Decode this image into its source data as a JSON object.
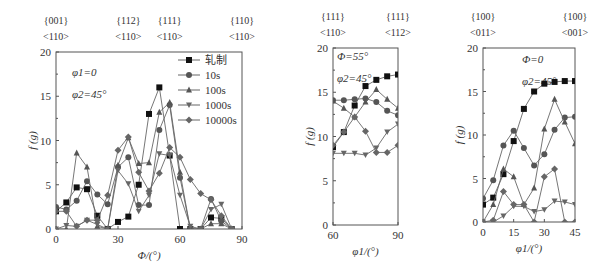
{
  "chart_data": [
    {
      "type": "line",
      "title": "",
      "xlabel": "Φ/(°)",
      "ylabel": "f (g)",
      "xlim": [
        0,
        90
      ],
      "ylim": [
        0,
        20
      ],
      "xticks": [
        0,
        30,
        60,
        90
      ],
      "yticks": [
        0,
        5,
        10,
        15,
        20
      ],
      "top_labels": [
        {
          "x": 0,
          "plane": "{001}",
          "dir": "<110>"
        },
        {
          "x": 35,
          "plane": "{112}",
          "dir": "<110>"
        },
        {
          "x": 55,
          "plane": "{111}",
          "dir": "<110>"
        },
        {
          "x": 90,
          "plane": "{110}",
          "dir": "<110>"
        }
      ],
      "annotations": [
        "φ1=0",
        "φ2=45°"
      ],
      "legend": [
        "轧制",
        "10s",
        "100s",
        "1000s",
        "10000s"
      ],
      "legend_position": "upper right",
      "grid": false,
      "series": [
        {
          "name": "轧制",
          "marker": "square",
          "x": [
            0,
            5,
            10,
            15,
            20,
            25,
            30,
            35,
            40,
            45,
            50,
            55,
            60,
            65,
            70,
            75,
            80,
            85
          ],
          "values": [
            2,
            3,
            4.7,
            4.5,
            1.5,
            0,
            0.8,
            1.4,
            5,
            13,
            16,
            8.3,
            0,
            0,
            0,
            1.3,
            1.2,
            0
          ]
        },
        {
          "name": "10s",
          "marker": "circle",
          "x": [
            0,
            5,
            10,
            15,
            20,
            25,
            30,
            35,
            40,
            45,
            50,
            55,
            60,
            65,
            70,
            75,
            80,
            85
          ],
          "values": [
            2.5,
            2.2,
            3.2,
            5.4,
            3.9,
            2.8,
            7,
            8.1,
            2.7,
            2.7,
            11.2,
            14,
            5.8,
            0,
            0,
            3.4,
            0.9,
            0
          ]
        },
        {
          "name": "100s",
          "marker": "triangle-up",
          "x": [
            0,
            5,
            10,
            15,
            20,
            25,
            30,
            35,
            40,
            45,
            50,
            55,
            60,
            65,
            70,
            75,
            80,
            85
          ],
          "values": [
            0,
            0,
            8.6,
            7,
            0.3,
            0,
            7.2,
            10.3,
            7.4,
            7.5,
            13.2,
            14.3,
            6.4,
            0,
            0,
            0.6,
            0.6,
            0
          ]
        },
        {
          "name": "1000s",
          "marker": "triangle-down",
          "x": [
            0,
            5,
            10,
            15,
            20,
            25,
            30,
            35,
            40,
            45,
            50,
            55,
            60,
            65,
            70,
            75,
            80,
            85
          ],
          "values": [
            0,
            0.4,
            0.3,
            1,
            0.5,
            0,
            6.6,
            5.1,
            2,
            3.8,
            8.5,
            8.3,
            3.8,
            0.3,
            0,
            2.2,
            2.8,
            0
          ]
        },
        {
          "name": "10000s",
          "marker": "diamond",
          "x": [
            0,
            5,
            10,
            15,
            20,
            25,
            30,
            35,
            40,
            45,
            50,
            55,
            60,
            65,
            70,
            75,
            80,
            85
          ],
          "values": [
            2,
            2,
            0.3,
            1,
            1,
            3.8,
            8.9,
            10.4,
            6.4,
            4.3,
            6.3,
            9.2,
            8.1,
            5.6,
            4,
            3.3,
            1.5,
            0
          ]
        }
      ]
    },
    {
      "type": "line",
      "title": "",
      "xlabel": "φ1/(°)",
      "ylabel": "f (g)",
      "xlim": [
        60,
        90
      ],
      "ylim": [
        0,
        20
      ],
      "xticks": [
        60,
        90
      ],
      "yticks": [
        0,
        5,
        10,
        15,
        20
      ],
      "top_labels": [
        {
          "x": 60,
          "plane": "{111}",
          "dir": "<110>"
        },
        {
          "x": 90,
          "plane": "{111}",
          "dir": "<112>"
        }
      ],
      "annotations": [
        "Φ=55°",
        "φ2=45°"
      ],
      "grid": false,
      "series": [
        {
          "name": "轧制",
          "marker": "square",
          "x": [
            60,
            65,
            70,
            75,
            80,
            85,
            90
          ],
          "values": [
            8.8,
            10.5,
            13.5,
            15.7,
            16.4,
            16.8,
            17
          ]
        },
        {
          "name": "10s",
          "marker": "circle",
          "x": [
            60,
            65,
            70,
            75,
            80,
            85,
            90
          ],
          "values": [
            14.1,
            14.1,
            14.2,
            14.3,
            13.9,
            12.9,
            12.4
          ]
        },
        {
          "name": "100s",
          "marker": "triangle-up",
          "x": [
            60,
            65,
            70,
            75,
            80,
            85,
            90
          ],
          "values": [
            14,
            13.2,
            12.2,
            13.9,
            15.3,
            14.2,
            13.2
          ]
        },
        {
          "name": "1000s",
          "marker": "triangle-down",
          "x": [
            60,
            65,
            70,
            75,
            80,
            85,
            90
          ],
          "values": [
            8.1,
            8.1,
            8.1,
            7.9,
            8.7,
            10.5,
            11.4
          ]
        },
        {
          "name": "10000s",
          "marker": "diamond",
          "x": [
            60,
            65,
            70,
            75,
            80,
            85,
            90
          ],
          "values": [
            9,
            10.5,
            12.2,
            10.6,
            8.2,
            8.2,
            9
          ]
        }
      ]
    },
    {
      "type": "line",
      "title": "",
      "xlabel": "φ1/(°)",
      "ylabel": "f (g)",
      "xlim": [
        0,
        45
      ],
      "ylim": [
        0,
        20
      ],
      "xticks": [
        0,
        15,
        30,
        45
      ],
      "yticks": [
        0,
        5,
        10,
        15,
        20
      ],
      "top_labels": [
        {
          "x": 0,
          "plane": "{100}",
          "dir": "<011>"
        },
        {
          "x": 45,
          "plane": "{100}",
          "dir": "<001>"
        }
      ],
      "annotations": [
        "Φ=0",
        "φ2=45°"
      ],
      "grid": false,
      "series": [
        {
          "name": "轧制",
          "marker": "square",
          "x": [
            0,
            5,
            10,
            15,
            20,
            25,
            30,
            35,
            40,
            45
          ],
          "values": [
            2,
            2.8,
            5.5,
            9.3,
            13,
            15,
            15.9,
            16.1,
            16.2,
            16.2
          ]
        },
        {
          "name": "10s",
          "marker": "circle",
          "x": [
            0,
            5,
            10,
            15,
            20,
            25,
            30,
            35,
            40,
            45
          ],
          "values": [
            2.7,
            4.8,
            8.8,
            10.5,
            8.5,
            6.5,
            7.8,
            10.6,
            12,
            12.1
          ]
        },
        {
          "name": "100s",
          "marker": "triangle-up",
          "x": [
            0,
            5,
            10,
            15,
            20,
            25,
            30,
            35,
            40,
            45
          ],
          "values": [
            0,
            2,
            6.1,
            5.2,
            2,
            3.9,
            10.7,
            14.1,
            11.5,
            9
          ]
        },
        {
          "name": "1000s",
          "marker": "triangle-down",
          "x": [
            0,
            5,
            10,
            15,
            20,
            25,
            30,
            35,
            40,
            45
          ],
          "values": [
            0,
            0,
            0.7,
            1.8,
            1.8,
            1.2,
            1.4,
            2.4,
            2.3,
            2
          ]
        },
        {
          "name": "10000s",
          "marker": "diamond",
          "x": [
            0,
            5,
            10,
            15,
            20,
            25,
            30,
            35,
            40,
            45
          ],
          "values": [
            0,
            0.2,
            3.5,
            2,
            2,
            0,
            5.2,
            6.1,
            0,
            0
          ]
        }
      ]
    }
  ],
  "figure": {
    "panels": [
      {
        "ylabel": "f (g)",
        "xlabel": "Φ/(°)",
        "annotation_1": "φ1=0",
        "annotation_2": "φ2=45°"
      },
      {
        "ylabel": "f (g)",
        "xlabel": "φ1/(°)",
        "annotation_1": "Φ=55°",
        "annotation_2": "φ2=45°"
      },
      {
        "ylabel": "f (g)",
        "xlabel": "φ1/(°)",
        "annotation_1": "Φ=0",
        "annotation_2": "φ2=45°"
      }
    ],
    "legend": [
      "轧制",
      "10s",
      "100s",
      "1000s",
      "10000s"
    ],
    "series_colors": {
      "轧制": "#111111",
      "10s": "#555555",
      "100s": "#555555",
      "1000s": "#666666",
      "10000s": "#666666"
    }
  }
}
